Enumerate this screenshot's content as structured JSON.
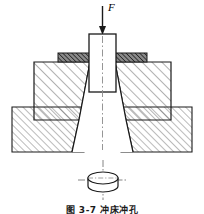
{
  "figure": {
    "title_caption": "图 3-7  冲床冲孔",
    "force_label": "F",
    "centerline_style": "dash-dot",
    "background_color": "#ffffff",
    "line_color": "#1a1a1a",
    "hatch_color": "#555555",
    "strip_fill_color": "#6b6b6b",
    "centerline_color": "#777777"
  },
  "parts": [
    {
      "id": "punch",
      "label": "Punch",
      "fill": "#ffffff"
    },
    {
      "id": "sheet-strip",
      "label": "Sheet strip",
      "fill": "#6b6b6b"
    },
    {
      "id": "die-block",
      "label": "Die block",
      "fill": "#ffffff"
    },
    {
      "id": "base-support",
      "label": "Base support",
      "fill": "#ffffff"
    },
    {
      "id": "die-opening",
      "label": "Tapered die hole",
      "fill": "#ffffff"
    },
    {
      "id": "slug",
      "label": "Punched slug",
      "fill": "#ffffff"
    }
  ],
  "annotations": {
    "arrow_direction": "down",
    "arrow_top_y": 6,
    "arrow_tip_y": 34
  }
}
